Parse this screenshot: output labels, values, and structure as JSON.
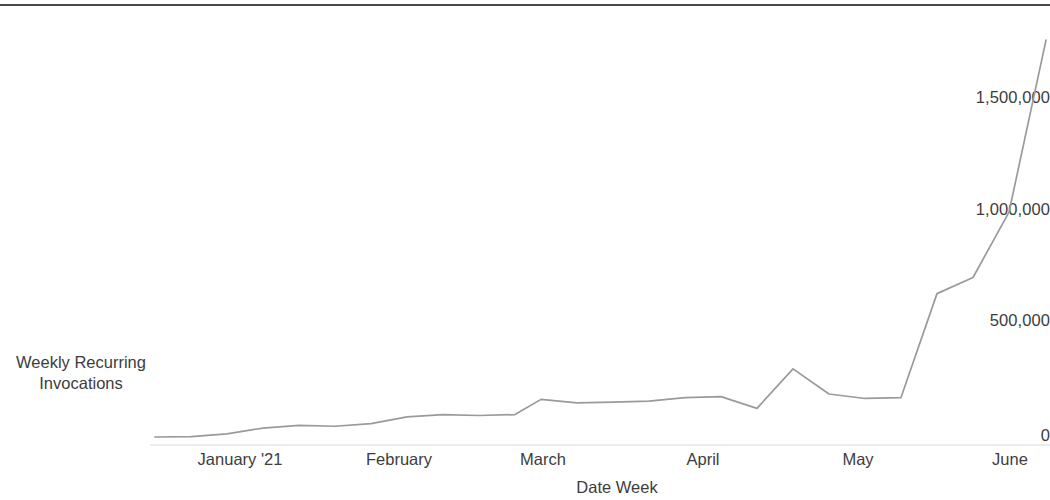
{
  "chart_data": {
    "type": "line",
    "title": "",
    "xlabel": "Date Week",
    "ylabel": "Weekly Recurring Invocations",
    "grid": false,
    "legend": "none",
    "line_color": "#9a9a9a",
    "baseline_color": "#d9d9d9",
    "ylim": [
      0,
      1800000
    ],
    "yticks": [
      0,
      500000,
      1000000,
      1500000
    ],
    "ytick_labels": [
      "0",
      "500,000",
      "1,000,000",
      "1,500,000"
    ],
    "xtick_labels": [
      "January '21",
      "February",
      "March",
      "April",
      "May",
      "June"
    ],
    "xtick_positions": [
      240,
      399,
      543,
      703,
      858,
      1010
    ],
    "x": [
      "2020-12-27",
      "2021-01-03",
      "2021-01-10",
      "2021-01-17",
      "2021-01-24",
      "2021-01-31",
      "2021-02-07",
      "2021-02-14",
      "2021-02-21",
      "2021-02-28",
      "2021-03-07",
      "2021-03-14",
      "2021-03-21",
      "2021-03-28",
      "2021-04-04",
      "2021-04-11",
      "2021-04-18",
      "2021-04-25",
      "2021-05-02",
      "2021-05-09",
      "2021-05-16",
      "2021-05-23",
      "2021-05-30",
      "2021-06-06",
      "2021-06-13"
    ],
    "values": [
      2000,
      6000,
      14000,
      30000,
      50000,
      56000,
      42000,
      60000,
      88000,
      104000,
      96000,
      98000,
      100000,
      90000,
      170000,
      152000,
      156000,
      160000,
      178000,
      128000,
      304000,
      190000,
      168000,
      176000,
      640000
    ],
    "values_tail": [
      {
        "x": "2021-06-06",
        "y": 640000
      },
      {
        "x": "2021-06-13",
        "y": 712000
      },
      {
        "x": "2021-06-20",
        "y": 1004000
      },
      {
        "x": "2021-06-27",
        "y": 1772000
      }
    ],
    "series": [
      {
        "name": "Weekly Recurring Invocations",
        "points": [
          [
            155,
            0
          ],
          [
            191,
            2000
          ],
          [
            227,
            14000
          ],
          [
            263,
            40000
          ],
          [
            299,
            52000
          ],
          [
            335,
            48000
          ],
          [
            371,
            60000
          ],
          [
            407,
            90000
          ],
          [
            443,
            100000
          ],
          [
            479,
            96000
          ],
          [
            515,
            100000
          ],
          [
            541,
            168000
          ],
          [
            577,
            152000
          ],
          [
            613,
            156000
          ],
          [
            649,
            160000
          ],
          [
            685,
            176000
          ],
          [
            721,
            180000
          ],
          [
            757,
            128000
          ],
          [
            793,
            304000
          ],
          [
            829,
            192000
          ],
          [
            865,
            172000
          ],
          [
            901,
            176000
          ],
          [
            937,
            640000
          ],
          [
            973,
            712000
          ],
          [
            1009,
            1004000
          ],
          [
            1046,
            1772000
          ]
        ]
      }
    ]
  }
}
